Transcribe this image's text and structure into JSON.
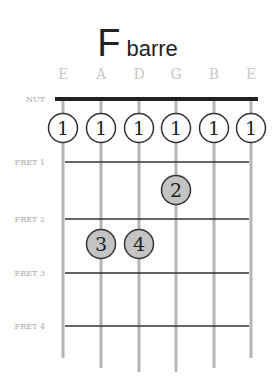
{
  "title": {
    "chord": "F",
    "type": "barre"
  },
  "strings": [
    "E",
    "A",
    "D",
    "G",
    "B",
    "E"
  ],
  "labels": {
    "nut": "NUT",
    "frets": [
      "FRET 1",
      "FRET 2",
      "FRET 3",
      "FRET 4"
    ]
  },
  "fingers": [
    {
      "string": 0,
      "fret": 0,
      "label": "1",
      "style": "open"
    },
    {
      "string": 1,
      "fret": 0,
      "label": "1",
      "style": "open"
    },
    {
      "string": 2,
      "fret": 0,
      "label": "1",
      "style": "open"
    },
    {
      "string": 3,
      "fret": 0,
      "label": "1",
      "style": "open"
    },
    {
      "string": 4,
      "fret": 0,
      "label": "1",
      "style": "open"
    },
    {
      "string": 5,
      "fret": 0,
      "label": "1",
      "style": "open"
    },
    {
      "string": 3,
      "fret": 1,
      "label": "2",
      "style": "filled"
    },
    {
      "string": 1,
      "fret": 2,
      "label": "3",
      "style": "filled"
    },
    {
      "string": 2,
      "fret": 2,
      "label": "4",
      "style": "filled"
    }
  ],
  "colors": {
    "string": "#b5b5b5",
    "fret": "#333333",
    "nut": "#222222",
    "filled": "#c4c4c4",
    "label": "#bdbdbd"
  }
}
